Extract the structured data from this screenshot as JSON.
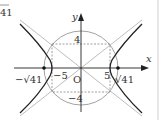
{
  "diagram": {
    "title_fragment": "41",
    "axes": {
      "x_label": "x",
      "y_label": "y",
      "origin_label": "O"
    },
    "tick_labels": {
      "pos_y": "4",
      "neg_y": "−4",
      "neg_x": "−5",
      "pos_x": "5",
      "neg_focus": "−√41",
      "pos_focus": "√41"
    },
    "curves": {
      "hyperbola": "x²/25 − y²/16 = 1",
      "asymptotes": [
        "y = 4x/5",
        "y = −4x/5"
      ],
      "circle": "x² + y² = 41"
    },
    "colors": {
      "curve": "#222222",
      "asymptote": "#b0b0b0",
      "circle": "#888888",
      "axis": "#222222",
      "dashed": "#777777"
    }
  }
}
